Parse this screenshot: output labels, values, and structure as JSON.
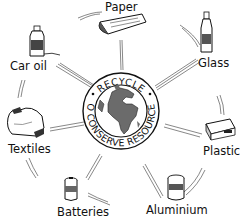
{
  "diagram": {
    "center": {
      "top_text": "RECYCLE",
      "bottom_text": "TO CONSERVE RESOURCES",
      "icon": "globe-icon"
    },
    "items": [
      {
        "label": "Paper",
        "icon": "newspaper-icon"
      },
      {
        "label": "Glass",
        "icon": "glass-bottle-icon"
      },
      {
        "label": "Plastics",
        "icon": "plastic-container-icon"
      },
      {
        "label": "Aluminium",
        "icon": "aluminium-can-icon"
      },
      {
        "label": "Batteries",
        "icon": "battery-icon"
      },
      {
        "label": "Textiles",
        "icon": "textiles-icon"
      },
      {
        "label": "Car oil",
        "icon": "oil-can-icon"
      }
    ],
    "colors": {
      "ink": "#111111",
      "ocean": "#ffffff",
      "land": "#6b6b6b",
      "background": "#ffffff"
    }
  }
}
